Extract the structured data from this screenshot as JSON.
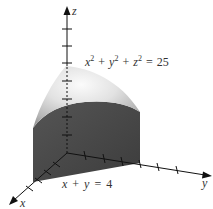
{
  "figure": {
    "type": "3d-solid-diagram"
  },
  "axes": {
    "x": {
      "label": "x"
    },
    "y": {
      "label": "y"
    },
    "z": {
      "label": "z"
    }
  },
  "labels": {
    "sphere_equation": {
      "lhs_x": "x",
      "sup1": "2",
      "plus1": "+",
      "lhs_y": "y",
      "sup2": "2",
      "plus2": "+",
      "lhs_z": "z",
      "sup3": "2",
      "equals": "=",
      "rhs": "25"
    },
    "plane_equation": {
      "x": "x",
      "plus": "+",
      "y": "y",
      "equals": "=",
      "rhs": "4"
    }
  },
  "colors": {
    "cap_light": "#f2f2f2",
    "cap_mid": "#c8c8c8",
    "cap_dark": "#9a9a9a",
    "face_dark": "#4a4a4a",
    "floor_dark": "#3a3a3a",
    "axis": "#111111",
    "text": "#333333"
  }
}
